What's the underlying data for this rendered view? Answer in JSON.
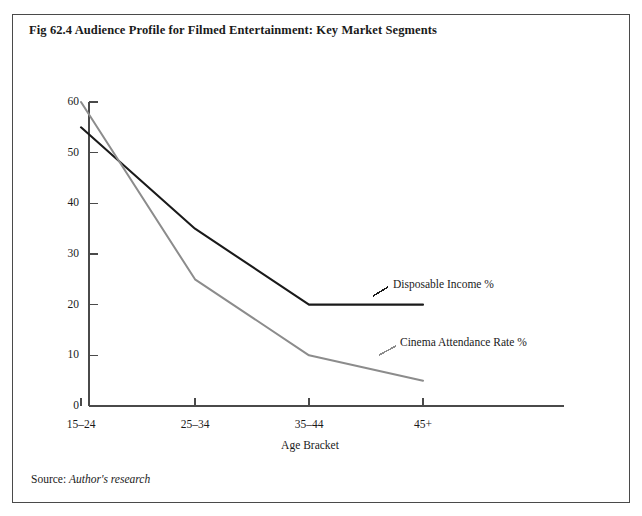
{
  "figure": {
    "title": "Fig 62.4 Audience Profile for Filmed Entertainment: Key Market Segments",
    "source_label": "Source:",
    "source_value": "Author's research"
  },
  "chart_data": {
    "type": "line",
    "title": "Fig 62.4 Audience Profile for Filmed Entertainment: Key Market Segments",
    "xlabel": "Age Bracket",
    "ylabel": "",
    "categories": [
      "15–24",
      "25–34",
      "35–44",
      "45+"
    ],
    "series": [
      {
        "name": "Disposable Income %",
        "values": [
          55,
          35,
          20,
          20
        ],
        "color": "#1a1a1a"
      },
      {
        "name": "Cinema Attendance Rate %",
        "values": [
          60,
          25,
          10,
          5
        ],
        "color": "#8c8c8c"
      }
    ],
    "yticks": [
      0,
      10,
      20,
      30,
      40,
      50,
      60
    ],
    "ylim": [
      0,
      60
    ],
    "grid": false,
    "legend": "inline-annotations",
    "annotations": [
      {
        "text": "Disposable Income %",
        "series": "Disposable Income %"
      },
      {
        "text": "Cinema Attendance Rate %",
        "series": "Cinema Attendance Rate %"
      }
    ]
  }
}
